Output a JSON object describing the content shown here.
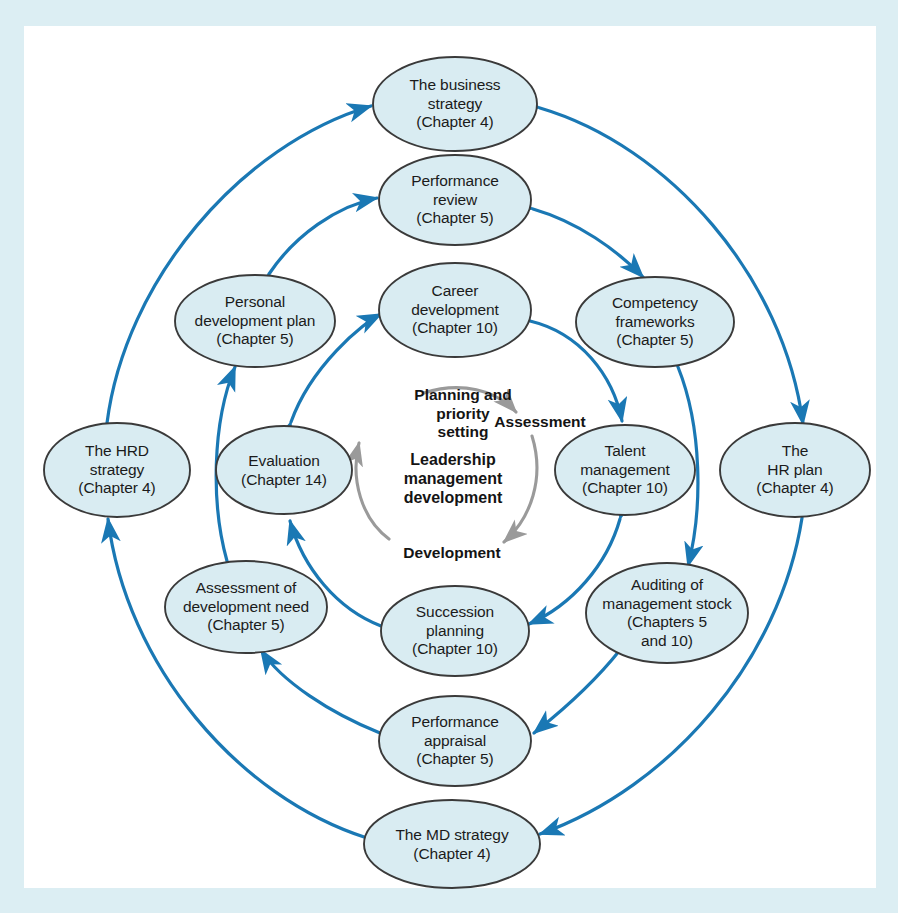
{
  "diagram": {
    "colors": {
      "page_border": "#dceef3",
      "sheet": "#ffffff",
      "node_fill": "#d9ecf2",
      "node_stroke": "#3a3a3a",
      "arrow_blue": "#1a78b4",
      "arrow_gray": "#9a9a9a",
      "text": "#1b1b1b"
    },
    "center_cycle": {
      "center_label_lines": [
        "Leadership",
        "management",
        "development"
      ],
      "steps": [
        {
          "id": "planning",
          "lines": [
            "Planning and",
            "priority",
            "setting"
          ]
        },
        {
          "id": "assessment",
          "lines": [
            "Assessment"
          ]
        },
        {
          "id": "development",
          "lines": [
            "Development"
          ]
        }
      ]
    },
    "rings": [
      {
        "name": "inner-ring",
        "nodes": [
          {
            "id": "career-development",
            "lines": [
              "Career",
              "development",
              "(Chapter 10)"
            ],
            "cx": 455,
            "cy": 310,
            "rx": 76,
            "ry": 47
          },
          {
            "id": "talent-management",
            "lines": [
              "Talent",
              "management",
              "(Chapter 10)"
            ],
            "cx": 625,
            "cy": 470,
            "rx": 70,
            "ry": 45
          },
          {
            "id": "succession-planning",
            "lines": [
              "Succession",
              "planning",
              "(Chapter 10)"
            ],
            "cx": 455,
            "cy": 631,
            "rx": 74,
            "ry": 45
          },
          {
            "id": "evaluation",
            "lines": [
              "Evaluation",
              "(Chapter 14)"
            ],
            "cx": 284,
            "cy": 470,
            "rx": 68,
            "ry": 44
          }
        ]
      },
      {
        "name": "middle-ring",
        "nodes": [
          {
            "id": "performance-review",
            "lines": [
              "Performance",
              "review",
              "(Chapter 5)"
            ],
            "cx": 455,
            "cy": 200,
            "rx": 76,
            "ry": 45
          },
          {
            "id": "competency-frameworks",
            "lines": [
              "Competency",
              "frameworks",
              "(Chapter 5)"
            ],
            "cx": 655,
            "cy": 322,
            "rx": 79,
            "ry": 45
          },
          {
            "id": "auditing-of-management-stock",
            "lines": [
              "Auditing of",
              "management stock",
              "(Chapters 5",
              "and 10)"
            ],
            "cx": 667,
            "cy": 613,
            "rx": 81,
            "ry": 50
          },
          {
            "id": "performance-appraisal",
            "lines": [
              "Performance",
              "appraisal",
              "(Chapter 5)"
            ],
            "cx": 455,
            "cy": 741,
            "rx": 76,
            "ry": 45
          },
          {
            "id": "assessment-of-development-need",
            "lines": [
              "Assessment of",
              "development need",
              "(Chapter 5)"
            ],
            "cx": 246,
            "cy": 607,
            "rx": 81,
            "ry": 46
          },
          {
            "id": "personal-development-plan",
            "lines": [
              "Personal",
              "development plan",
              "(Chapter 5)"
            ],
            "cx": 255,
            "cy": 321,
            "rx": 80,
            "ry": 46
          }
        ]
      },
      {
        "name": "outer-ring",
        "nodes": [
          {
            "id": "the-business-strategy",
            "lines": [
              "The business",
              "strategy",
              "(Chapter 4)"
            ],
            "cx": 455,
            "cy": 104,
            "rx": 82,
            "ry": 47
          },
          {
            "id": "the-hr-plan",
            "lines": [
              "The",
              "HR plan",
              "(Chapter 4)"
            ],
            "cx": 795,
            "cy": 470,
            "rx": 75,
            "ry": 47
          },
          {
            "id": "the-md-strategy",
            "lines": [
              "The MD strategy",
              "(Chapter 4)"
            ],
            "cx": 452,
            "cy": 844,
            "rx": 88,
            "ry": 44
          },
          {
            "id": "the-hrd-strategy",
            "lines": [
              "The HRD",
              "strategy",
              "(Chapter 4)"
            ],
            "cx": 117,
            "cy": 470,
            "rx": 73,
            "ry": 47
          }
        ]
      }
    ]
  }
}
